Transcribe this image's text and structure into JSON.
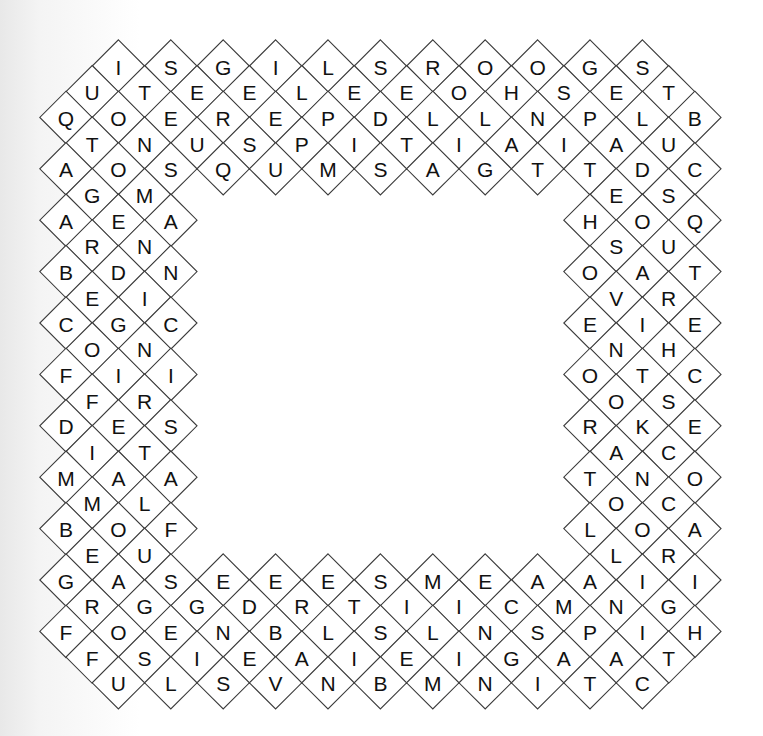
{
  "puzzle": {
    "type": "diamond word search",
    "geometry": {
      "origin_x": 66,
      "origin_y": 66,
      "col_step": 26.2,
      "row_step": 25.7,
      "half_diag": 26.2
    },
    "colors": {
      "line": "#3a3a3a",
      "text": "#111111",
      "cell": "#ffffff"
    },
    "rows": [
      {
        "r": 0,
        "segments": [
          {
            "start_col": 2,
            "letters": "ISGILSROOGS"
          }
        ]
      },
      {
        "r": 1,
        "segments": [
          {
            "start_col": 1,
            "letters": "UTEELEEOHSET"
          }
        ]
      },
      {
        "r": 2,
        "segments": [
          {
            "start_col": 0,
            "letters": "QOEREPDLLNPLB"
          }
        ]
      },
      {
        "r": 3,
        "segments": [
          {
            "start_col": 1,
            "letters": "TNUSPITIAIAU"
          }
        ]
      },
      {
        "r": 4,
        "segments": [
          {
            "start_col": 0,
            "letters": "AOSQUMSAGTTDC"
          }
        ]
      },
      {
        "r": 5,
        "segments": [
          {
            "start_col": 1,
            "letters": "GM"
          },
          {
            "start_col": 21,
            "letters": "ES"
          }
        ]
      },
      {
        "r": 6,
        "segments": [
          {
            "start_col": 0,
            "letters": "AEA"
          },
          {
            "start_col": 20,
            "letters": "HOQ"
          }
        ]
      },
      {
        "r": 7,
        "segments": [
          {
            "start_col": 1,
            "letters": "RN"
          },
          {
            "start_col": 21,
            "letters": "SU"
          }
        ]
      },
      {
        "r": 8,
        "segments": [
          {
            "start_col": 0,
            "letters": "BDN"
          },
          {
            "start_col": 20,
            "letters": "OAT"
          }
        ]
      },
      {
        "r": 9,
        "segments": [
          {
            "start_col": 1,
            "letters": "EI"
          },
          {
            "start_col": 21,
            "letters": "VR"
          }
        ]
      },
      {
        "r": 10,
        "segments": [
          {
            "start_col": 0,
            "letters": "CGC"
          },
          {
            "start_col": 20,
            "letters": "EIE"
          }
        ]
      },
      {
        "r": 11,
        "segments": [
          {
            "start_col": 1,
            "letters": "ON"
          },
          {
            "start_col": 21,
            "letters": "NH"
          }
        ]
      },
      {
        "r": 12,
        "segments": [
          {
            "start_col": 0,
            "letters": "FII"
          },
          {
            "start_col": 20,
            "letters": "OTC"
          }
        ]
      },
      {
        "r": 13,
        "segments": [
          {
            "start_col": 1,
            "letters": "FR"
          },
          {
            "start_col": 21,
            "letters": "OS"
          }
        ]
      },
      {
        "r": 14,
        "segments": [
          {
            "start_col": 0,
            "letters": "DES"
          },
          {
            "start_col": 20,
            "letters": "RKE"
          }
        ]
      },
      {
        "r": 15,
        "segments": [
          {
            "start_col": 1,
            "letters": "IT"
          },
          {
            "start_col": 21,
            "letters": "AC"
          }
        ]
      },
      {
        "r": 16,
        "segments": [
          {
            "start_col": 0,
            "letters": "MAA"
          },
          {
            "start_col": 20,
            "letters": "TNO"
          }
        ]
      },
      {
        "r": 17,
        "segments": [
          {
            "start_col": 1,
            "letters": "ML"
          },
          {
            "start_col": 21,
            "letters": "OC"
          }
        ]
      },
      {
        "r": 18,
        "segments": [
          {
            "start_col": 0,
            "letters": "BOF"
          },
          {
            "start_col": 20,
            "letters": "LOA"
          }
        ]
      },
      {
        "r": 19,
        "segments": [
          {
            "start_col": 1,
            "letters": "EU"
          },
          {
            "start_col": 21,
            "letters": "LR"
          }
        ]
      },
      {
        "r": 20,
        "segments": [
          {
            "start_col": 0,
            "letters": "GASEEESMEAAII"
          }
        ]
      },
      {
        "r": 21,
        "segments": [
          {
            "start_col": 1,
            "letters": "RGGDRTIICMNG"
          }
        ]
      },
      {
        "r": 22,
        "segments": [
          {
            "start_col": 0,
            "letters": "FOENBLSLNSPIH"
          }
        ]
      },
      {
        "r": 23,
        "segments": [
          {
            "start_col": 1,
            "letters": "FSIEAIEIGAAT"
          }
        ]
      },
      {
        "r": 24,
        "segments": [
          {
            "start_col": 2,
            "letters": "ULSVNBMNITC"
          }
        ]
      }
    ]
  }
}
